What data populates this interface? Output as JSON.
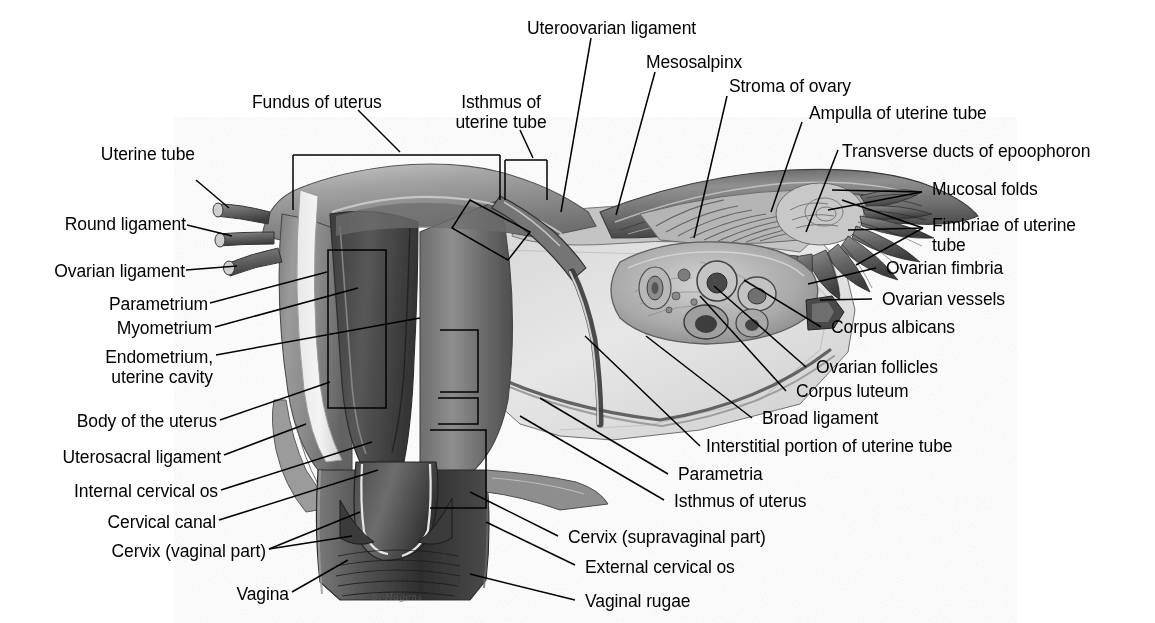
{
  "figure": {
    "kind": "anatomical-illustration",
    "style": "grayscale halftone medical illustration with leader lines and brackets",
    "background_color": "#ffffff",
    "text_color": "#000000",
    "line_color": "#000000",
    "artist_signature": "S. Hagens"
  },
  "labels_left": [
    {
      "id": "uterine-tube",
      "text": "Uterine tube"
    },
    {
      "id": "round-ligament",
      "text": "Round ligament"
    },
    {
      "id": "ovarian-ligament",
      "text": "Ovarian ligament"
    },
    {
      "id": "parametrium",
      "text": "Parametrium"
    },
    {
      "id": "myometrium",
      "text": "Myometrium"
    },
    {
      "id": "endometrium",
      "text": "Endometrium,\nuterine cavity"
    },
    {
      "id": "body-of-uterus",
      "text": "Body of the uterus"
    },
    {
      "id": "uterosacral-ligament",
      "text": "Uterosacral ligament"
    },
    {
      "id": "internal-cervical-os",
      "text": "Internal cervical os"
    },
    {
      "id": "cervical-canal",
      "text": "Cervical canal"
    },
    {
      "id": "cervix-vaginal-part",
      "text": "Cervix (vaginal part)"
    },
    {
      "id": "vagina",
      "text": "Vagina"
    }
  ],
  "labels_top": [
    {
      "id": "fundus-of-uterus",
      "text": "Fundus of uterus"
    },
    {
      "id": "isthmus-uterine-tube",
      "text": "Isthmus of\nuterine tube"
    },
    {
      "id": "uteroovarian-ligament",
      "text": "Uteroovarian ligament"
    },
    {
      "id": "mesosalpinx",
      "text": "Mesosalpinx"
    },
    {
      "id": "stroma-of-ovary",
      "text": "Stroma of ovary"
    },
    {
      "id": "ampulla-uterine-tube",
      "text": "Ampulla of uterine tube"
    },
    {
      "id": "transverse-ducts",
      "text": "Transverse ducts of epoophoron"
    }
  ],
  "labels_right": [
    {
      "id": "mucosal-folds",
      "text": "Mucosal folds"
    },
    {
      "id": "fimbriae",
      "text": "Fimbriae of uterine\ntube"
    },
    {
      "id": "ovarian-fimbria",
      "text": "Ovarian fimbria"
    },
    {
      "id": "ovarian-vessels",
      "text": "Ovarian vessels"
    },
    {
      "id": "corpus-albicans",
      "text": "Corpus albicans"
    },
    {
      "id": "ovarian-follicles",
      "text": "Ovarian follicles"
    },
    {
      "id": "corpus-luteum",
      "text": "Corpus luteum"
    },
    {
      "id": "broad-ligament",
      "text": "Broad ligament"
    },
    {
      "id": "interstitial-portion",
      "text": "Interstitial portion of uterine tube"
    },
    {
      "id": "parametria",
      "text": "Parametria"
    },
    {
      "id": "isthmus-of-uterus",
      "text": "Isthmus of uterus"
    },
    {
      "id": "cervix-supravaginal",
      "text": "Cervix (supravaginal part)"
    },
    {
      "id": "external-cervical-os",
      "text": "External cervical os"
    },
    {
      "id": "vaginal-rugae",
      "text": "Vaginal rugae"
    }
  ]
}
